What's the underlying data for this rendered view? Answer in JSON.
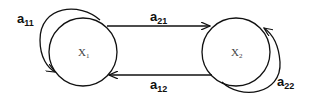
{
  "diagram": {
    "type": "state-transition",
    "nodes": [
      {
        "id": "x1",
        "label": "X",
        "subscript": "1"
      },
      {
        "id": "x2",
        "label": "X",
        "subscript": "2"
      }
    ],
    "edges": [
      {
        "id": "a11",
        "from": "x1",
        "to": "x1",
        "label": "a",
        "subscript": "11"
      },
      {
        "id": "a21",
        "from": "x1",
        "to": "x2",
        "label": "a",
        "subscript": "21"
      },
      {
        "id": "a12",
        "from": "x2",
        "to": "x1",
        "label": "a",
        "subscript": "12"
      },
      {
        "id": "a22",
        "from": "x2",
        "to": "x2",
        "label": "a",
        "subscript": "22"
      }
    ],
    "colors": {
      "stroke": "#111111",
      "background": "#ffffff"
    }
  }
}
